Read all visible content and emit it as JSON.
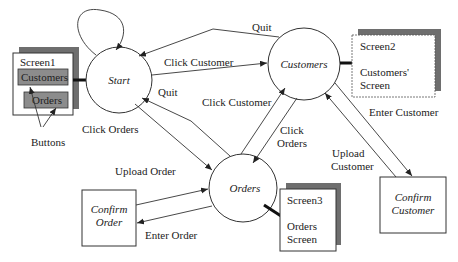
{
  "diagram": {
    "states": {
      "start": "Start",
      "customers": "Customers",
      "orders": "Orders",
      "confirm_order": [
        "Confirm",
        "Order"
      ],
      "confirm_customer": [
        "Confirm",
        "Customer"
      ]
    },
    "screens": {
      "screen1": {
        "title": "Screen1",
        "buttons": [
          "Customers",
          "Orders"
        ],
        "annotation": "Buttons"
      },
      "screen2": {
        "title": "Screen2",
        "body": [
          "Customers'",
          "Screen"
        ]
      },
      "screen3": {
        "title": "Screen3",
        "body": [
          "Orders",
          "Screen"
        ]
      }
    },
    "transitions": {
      "quit_top": "Quit",
      "click_customer_top": "Click Customer",
      "quit_mid": "Quit",
      "click_orders_left": "Click Orders",
      "click_customer_mid": "Click Customer",
      "click_orders_right": [
        "Click",
        "Orders"
      ],
      "upload_order": "Upload Order",
      "enter_order": "Enter Order",
      "enter_customer": "Enter Customer",
      "upload_customer": [
        "Upload",
        "Customer"
      ]
    }
  }
}
